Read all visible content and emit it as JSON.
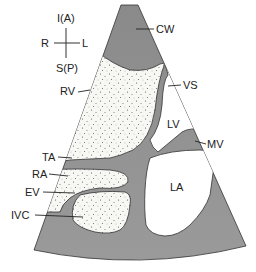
{
  "diagram": {
    "type": "echocardiogram-subcostal-view",
    "orientation": {
      "top": "I(A)",
      "left": "R",
      "right": "L",
      "bottom": "S(P)"
    },
    "structures": {
      "cw": "CW",
      "rv": "RV",
      "vs": "VS",
      "lv": "LV",
      "mv": "MV",
      "ta": "TA",
      "ra": "RA",
      "ev": "EV",
      "ivc": "IVC",
      "la": "LA"
    },
    "colors": {
      "tissue": "#8e8e8e",
      "tissue_light": "#a6a6a6",
      "outline": "#333333",
      "blood_speckled": "#f7f7f4",
      "chamber_clear": "#ffffff"
    }
  }
}
